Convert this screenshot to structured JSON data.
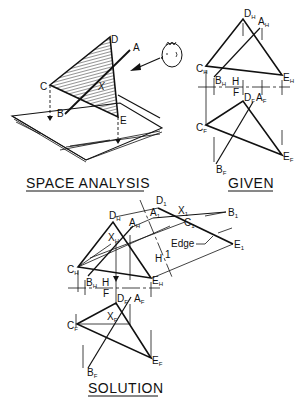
{
  "captions": {
    "space_analysis": "SPACE ANALYSIS",
    "given": "GIVEN",
    "solution": "SOLUTION"
  },
  "space_analysis": {
    "labels": {
      "C": "C",
      "D": "D",
      "A": "A",
      "B": "B",
      "E": "E",
      "X": "X"
    }
  },
  "given": {
    "labels": {
      "DH": "D",
      "DH_sub": "H",
      "AH": "A",
      "AH_sub": "H",
      "CH": "C",
      "CH_sub": "H",
      "EH": "E",
      "EH_sub": "H",
      "BH": "B",
      "BH_sub": "H",
      "fold_H": "H",
      "fold_F": "F",
      "DF": "D",
      "DF_sub": "F",
      "AF": "A",
      "AF_sub": "F",
      "CF": "C",
      "CF_sub": "F",
      "EF": "E",
      "EF_sub": "F",
      "BF": "B",
      "BF_sub": "F"
    }
  },
  "solution": {
    "labels": {
      "D1": "D",
      "D1_sub": "1",
      "A1": "A",
      "A1_sub": "1",
      "X1": "X",
      "X1_sub": "1",
      "B1": "B",
      "B1_sub": "1",
      "C1": "C",
      "C1_sub": "1",
      "E1": "E",
      "E1_sub": "1",
      "edge": "Edge",
      "fold1_H": "H",
      "fold1_1": "1",
      "DH": "D",
      "DH_sub": "H",
      "AH": "A",
      "AH_sub": "H",
      "XH": "X",
      "XH_sub": "H",
      "CH": "C",
      "CH_sub": "H",
      "EH": "E",
      "EH_sub": "H",
      "BH": "B",
      "BH_sub": "H",
      "fold_H": "H",
      "fold_F": "F",
      "DF": "D",
      "DF_sub": "F",
      "AF": "A",
      "AF_sub": "F",
      "XF": "X",
      "XF_sub": "F",
      "CF": "C",
      "CF_sub": "F",
      "EF": "E",
      "EF_sub": "F",
      "BF": "B",
      "BF_sub": "F"
    }
  }
}
